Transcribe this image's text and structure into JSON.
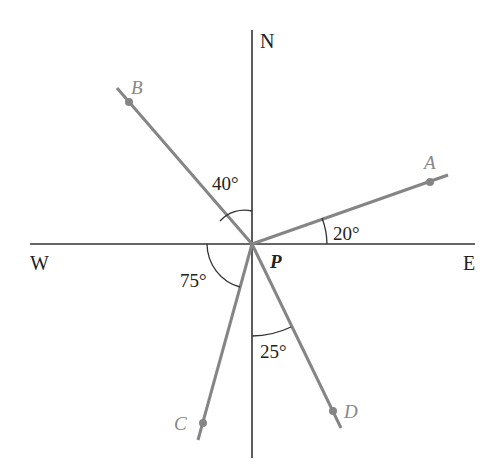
{
  "diagram": {
    "center": {
      "label": "P",
      "x": 252,
      "y": 244
    },
    "compass": {
      "north": "N",
      "south": "",
      "east": "E",
      "west": "W"
    },
    "rays": [
      {
        "id": "A",
        "label": "A",
        "bearing_description": "20° north of east",
        "angle_label": "20°",
        "angle_from": "E"
      },
      {
        "id": "B",
        "label": "B",
        "bearing_description": "40° west of north",
        "angle_label": "40°",
        "angle_from": "N"
      },
      {
        "id": "C",
        "label": "C",
        "bearing_description": "75° south of west",
        "angle_label": "75°",
        "angle_from": "W"
      },
      {
        "id": "D",
        "label": "D",
        "bearing_description": "25° east of south",
        "angle_label": "25°",
        "angle_from": "S"
      }
    ],
    "colors": {
      "axis": "#333333",
      "ray": "#858585",
      "text": "#222222",
      "point_label": "#888888"
    }
  }
}
